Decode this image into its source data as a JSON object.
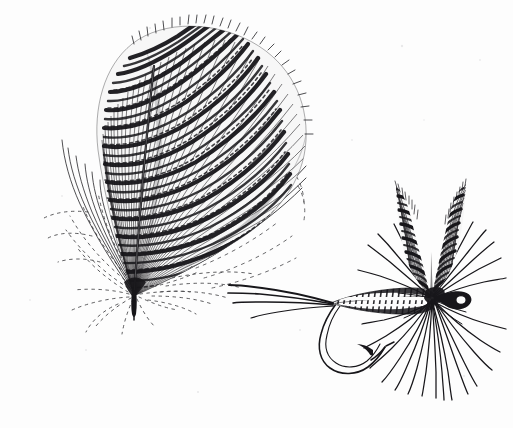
{
  "document": {
    "type": "engraving-illustration",
    "medium": "pen-and-ink line engraving",
    "background_color": "#fdfdfd",
    "ink_color": "#17161a",
    "width": 513,
    "height": 428,
    "caption": "",
    "subject": "Barred feather and the dry fly tied from it"
  },
  "figures": [
    {
      "id": "feather",
      "name": "barred-feather",
      "label": "Barred feather",
      "description": "Splayed barred body feather with dark transverse bars across fine barbs, solid rachis and wispy dotted basal fluff",
      "bbox": {
        "x": 18,
        "y": 18,
        "width": 290,
        "height": 300
      },
      "parts": [
        {
          "name": "vane",
          "label": "Barred vane"
        },
        {
          "name": "rachis",
          "label": "Rachis (central shaft)"
        },
        {
          "name": "quill",
          "label": "Quill / stem base"
        },
        {
          "name": "barbules",
          "label": "Wispy basal barbules"
        },
        {
          "name": "sweeping-barbs",
          "label": "Free sweeping barbs"
        }
      ]
    },
    {
      "id": "fly",
      "name": "dry-fly",
      "label": "Dry fly",
      "description": "Dry fly tied on an up-eye hook with divided barred upright wings, dubbed tapered body, radiating hackle and three tail whisks",
      "bbox": {
        "x": 228,
        "y": 182,
        "width": 280,
        "height": 218
      },
      "parts": [
        {
          "name": "wings",
          "label": "Divided barred wings"
        },
        {
          "name": "hackle",
          "label": "Radiating hackle fibres"
        },
        {
          "name": "body",
          "label": "Dubbed tapered body"
        },
        {
          "name": "tail",
          "label": "Tail whisks"
        },
        {
          "name": "hook",
          "label": "Hook shank and bend"
        },
        {
          "name": "hook-barb",
          "label": "Hook barb and point"
        },
        {
          "name": "hook-eye",
          "label": "Turned-up hook eye"
        }
      ]
    }
  ],
  "render": {
    "feather": {
      "tip_x": 134,
      "tip_y": 296,
      "bar_count": 26,
      "barb_count": 150,
      "fluff_arcs": 26,
      "sweep_curves": 7
    },
    "fly": {
      "hook_shank_y": 302,
      "body_start_x": 330,
      "body_end_x": 432,
      "wing_base_x": 430,
      "wing_base_y": 292,
      "wing_height": 108,
      "hackle_fibers": 30,
      "tail_fibers": 4,
      "eye_x": 466,
      "eye_y": 300
    }
  }
}
